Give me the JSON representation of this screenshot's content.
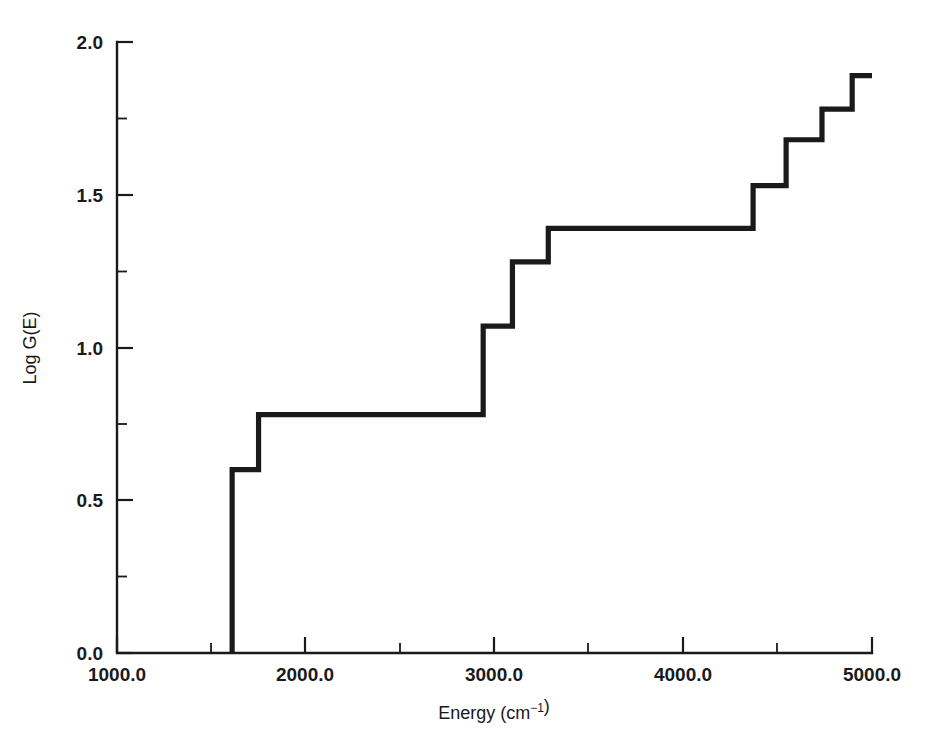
{
  "chart_data": {
    "type": "line",
    "subtype": "step-post",
    "title": "",
    "subtitle": "",
    "xlabel": "Energy (cm−1)",
    "ylabel": "Log G(E)",
    "xlim": [
      1000.0,
      5000.0
    ],
    "ylim": [
      0.0,
      2.0
    ],
    "grid": false,
    "legend": null,
    "x_ticks_major": [
      1000.0,
      2000.0,
      3000.0,
      4000.0,
      5000.0
    ],
    "x_tick_labels": [
      "1000.0",
      "2000.0",
      "3000.0",
      "4000.0",
      "5000.0"
    ],
    "x_ticks_minor": [
      1500.0,
      2500.0,
      3500.0,
      4500.0
    ],
    "y_ticks_major": [
      0.0,
      0.5,
      1.0,
      1.5,
      2.0
    ],
    "y_tick_labels": [
      "0.0",
      "0.5",
      "1.0",
      "1.5",
      "2.0"
    ],
    "y_ticks_minor": [
      0.25,
      0.75,
      1.25,
      1.75
    ],
    "line_color": "#1a1a1a",
    "background_color": "#ffffff",
    "series": [
      {
        "name": "Log G(E)",
        "x": [
          1610,
          1750,
          1930,
          2100,
          2240,
          2390,
          2530,
          2680,
          2830,
          2980,
          3090,
          3240,
          3390,
          3540,
          3690,
          3840,
          3990,
          4140,
          4290,
          4440,
          4590,
          4740,
          4890,
          5000
        ],
        "note": "cumulative density of states staircase; risers listed as (energy, level) pairs below",
        "steps": [
          {
            "energy": 1610,
            "level": 0.0
          },
          {
            "energy": 1610,
            "level": 0.6
          },
          {
            "energy": 1750,
            "level": 0.78
          },
          {
            "energy": 2940,
            "level": 1.07
          },
          {
            "energy": 3095,
            "level": 1.28
          },
          {
            "energy": 3285,
            "level": 1.39
          },
          {
            "energy": 4370,
            "level": 1.53
          },
          {
            "energy": 4545,
            "level": 1.68
          },
          {
            "energy": 4735,
            "level": 1.78
          },
          {
            "energy": 4895,
            "level": 1.89
          }
        ]
      }
    ],
    "step_levels": [
      0.6,
      0.78,
      1.07,
      1.28,
      1.39,
      1.53,
      1.68,
      1.78,
      1.89
    ],
    "step_energies": [
      1610,
      1750,
      2940,
      3095,
      3285,
      4370,
      4545,
      4735,
      4895
    ],
    "start_energy": 1610,
    "end_energy": 5000
  },
  "axes": {
    "x_axis_name": "energy-axis",
    "y_axis_name": "log-g-axis"
  }
}
